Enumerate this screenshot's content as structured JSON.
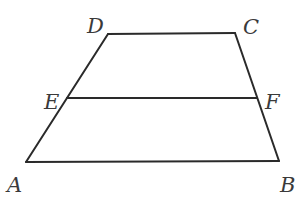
{
  "figure": {
    "type": "trapezoid",
    "stroke_color": "#2a2a2a",
    "label_color": "#3a3a3a",
    "vertices": {
      "A": {
        "x": 26,
        "y": 162
      },
      "B": {
        "x": 279,
        "y": 161
      },
      "C": {
        "x": 235,
        "y": 33
      },
      "D": {
        "x": 108,
        "y": 34
      },
      "E": {
        "x": 67,
        "y": 98
      },
      "F": {
        "x": 257,
        "y": 98
      }
    },
    "segments": [
      {
        "from": "A",
        "to": "B"
      },
      {
        "from": "B",
        "to": "C"
      },
      {
        "from": "C",
        "to": "D"
      },
      {
        "from": "D",
        "to": "A"
      },
      {
        "from": "E",
        "to": "F"
      }
    ],
    "labels": [
      {
        "text": "D",
        "x": 87,
        "y": 33
      },
      {
        "text": "C",
        "x": 243,
        "y": 34
      },
      {
        "text": "E",
        "x": 44,
        "y": 109
      },
      {
        "text": "F",
        "x": 265,
        "y": 109
      },
      {
        "text": "A",
        "x": 7,
        "y": 192
      },
      {
        "text": "B",
        "x": 280,
        "y": 192
      }
    ]
  }
}
